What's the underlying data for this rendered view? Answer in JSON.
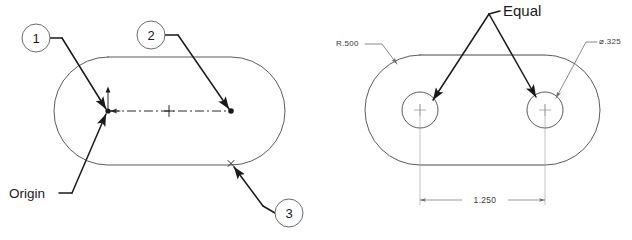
{
  "sheet": {
    "background": "#ffffff",
    "line_color": "#4a4a4a",
    "annotation_color": "#1a1a1a"
  },
  "left_view": {
    "name": "slot-sketch-callout-view",
    "balloons": [
      {
        "id": "balloon-1",
        "number": "1",
        "cx": 36,
        "cy": 38,
        "r": 14
      },
      {
        "id": "balloon-2",
        "number": "2",
        "cx": 151,
        "cy": 35,
        "r": 14
      },
      {
        "id": "balloon-3",
        "number": "3",
        "cx": 289,
        "cy": 213,
        "r": 14
      }
    ],
    "labels": {
      "origin": "Origin"
    },
    "sketch_entities": {
      "centerline_label": "construction-centerline",
      "origin_point": "sketch-origin",
      "endpoint": "centerline-endpoint",
      "midpoint": "centerline-midpoint",
      "edge_point": "bottom-edge-point"
    }
  },
  "right_view": {
    "name": "slot-dimension-view",
    "annotations": {
      "equal": "Equal",
      "radius": "R.500",
      "diameter": "⌀.325",
      "length": "1.250"
    },
    "holes": [
      {
        "id": "hole-left",
        "cx": 420,
        "cy": 110,
        "r": 18
      },
      {
        "id": "hole-right",
        "cx": 545,
        "cy": 110,
        "r": 18
      }
    ]
  }
}
